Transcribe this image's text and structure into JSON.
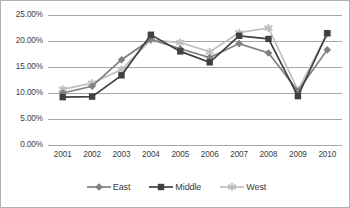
{
  "chart_data": {
    "type": "line",
    "title": "",
    "xlabel": "",
    "ylabel": "",
    "categories": [
      "2001",
      "2002",
      "2003",
      "2004",
      "2005",
      "2006",
      "2007",
      "2008",
      "2009",
      "2010"
    ],
    "series": [
      {
        "name": "East",
        "marker": "diamond",
        "color": "#808080",
        "values": [
          10.0,
          11.3,
          16.4,
          20.3,
          18.5,
          16.8,
          19.5,
          17.7,
          10.4,
          18.3
        ]
      },
      {
        "name": "Middle",
        "marker": "square",
        "color": "#404040",
        "values": [
          9.2,
          9.3,
          13.4,
          21.2,
          18.0,
          15.9,
          21.0,
          20.4,
          9.4,
          21.5
        ]
      },
      {
        "name": "West",
        "marker": "star",
        "color": "#bfbfbf",
        "values": [
          10.7,
          11.9,
          14.5,
          20.2,
          19.7,
          17.9,
          21.6,
          22.5,
          10.5,
          21.4
        ]
      }
    ],
    "ylim": [
      0,
      25
    ],
    "ytick_values": [
      0,
      5,
      10,
      15,
      20,
      25
    ],
    "ytick_labels": [
      "0.00%",
      "5.00%",
      "10.00%",
      "15.00%",
      "20.00%",
      "25.00%"
    ],
    "grid": true,
    "grid_color": "#a6a6a6",
    "legend_position": "bottom",
    "plot_background": "#ffffff",
    "border_color": "#b0b0b0"
  },
  "legend": {
    "entries": [
      {
        "label": "East"
      },
      {
        "label": "Middle"
      },
      {
        "label": "West"
      }
    ]
  }
}
